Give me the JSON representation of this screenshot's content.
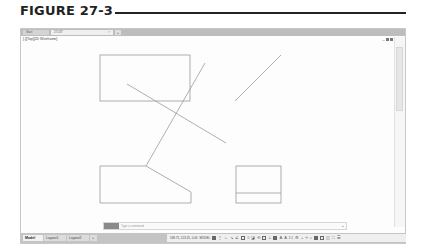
{
  "figure": {
    "title": "FIGURE 27-3"
  },
  "app": {
    "tabs": [
      {
        "label": "Start",
        "active": false
      },
      {
        "label": "27-03*",
        "active": true,
        "close": "×"
      }
    ],
    "new_tab_label": "+",
    "viewport_label": "[-][Top][2D Wireframe]",
    "viewport_controls": {
      "minimize": "—",
      "restore": "▣",
      "close": "×"
    }
  },
  "drawing": {
    "stroke_color": "#9a9a9a",
    "rect_top": {
      "x": 100,
      "y": 55,
      "w": 90,
      "h": 46
    },
    "line_a": {
      "x1": 127,
      "y1": 84,
      "x2": 226,
      "y2": 143
    },
    "line_b": {
      "x1": 205,
      "y1": 63,
      "x2": 146,
      "y2": 166
    },
    "line_c": {
      "x1": 281,
      "y1": 55,
      "x2": 235,
      "y2": 101
    },
    "poly_bottom_left": "100,166 146,166 191,192 191,203 100,203",
    "rect_bottom_right": {
      "x": 236,
      "y": 166,
      "w": 45,
      "h": 37,
      "divider_y": 193
    }
  },
  "command_line": {
    "placeholder": "Type a command",
    "arrow": "▴"
  },
  "layout_tabs": [
    {
      "label": "Model",
      "active": true
    },
    {
      "label": "Layout1",
      "active": false
    },
    {
      "label": "Layout2",
      "active": false
    },
    {
      "label": "+",
      "active": false
    }
  ],
  "status_bar": {
    "coordinates": "168.75, 123.25, 0.00",
    "mode": "MODEL",
    "icons": [
      "grid",
      "snap",
      "ortho",
      "polar",
      "osnap-tracking",
      "object-snap",
      "lineweight",
      "transparency",
      "selection-cycling",
      "3d-osnap",
      "dynamic-ucs",
      "annotation-visibility",
      "auto-scale",
      "annotation-scale",
      "workspace",
      "annotation-monitor",
      "units",
      "quick-properties",
      "lock-ui",
      "isolate-objects",
      "hardware-acceleration",
      "clean-screen",
      "customization"
    ],
    "scale": "1:1"
  }
}
